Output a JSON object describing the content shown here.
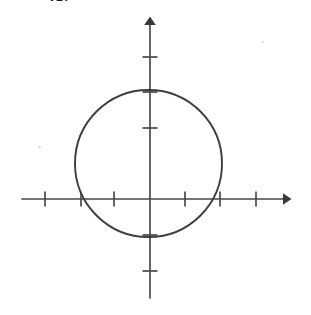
{
  "figure": {
    "problem_label": "41.",
    "background_color": "#ffffff",
    "stroke_color": "#3e3e3e",
    "axis_color": "#4a4a4a"
  },
  "chart_data": {
    "type": "scatter",
    "title": "",
    "subtitle": "",
    "xlabel": "",
    "ylabel": "",
    "grid": false,
    "legend": null,
    "axes": {
      "x": {
        "origin_px": 150,
        "axis_y_px": 199,
        "start_px": 22,
        "end_px": 290,
        "arrow": "right",
        "unit_px": 35.5,
        "tick_positions_px": [
          45,
          81,
          114,
          185,
          220,
          256
        ],
        "tick_values": [
          -3,
          -2,
          -1,
          1,
          2,
          3
        ],
        "tick_labels": [
          "",
          "",
          "",
          "",
          "",
          ""
        ],
        "xlim": [
          -3.6,
          3.9
        ]
      },
      "y": {
        "origin_px": 199,
        "axis_x_px": 150,
        "start_px": 17,
        "end_px": 298,
        "arrow": "up",
        "unit_px": 35.5,
        "tick_positions_px": [
          57,
          92,
          128,
          235,
          271
        ],
        "tick_values": [
          4,
          3,
          2,
          -1,
          -2
        ],
        "tick_labels": [
          "",
          "",
          "",
          "",
          ""
        ],
        "ylim": [
          -2.8,
          5.1
        ]
      }
    },
    "shapes": [
      {
        "kind": "circle",
        "center_units": [
          0,
          1
        ],
        "radius_units": 2,
        "center_px": [
          148.5,
          163.5
        ],
        "radius_px": 73.5,
        "stroke": "#3e3e3e",
        "stroke_width_px": 1.9,
        "fill": "none",
        "equation": "x^2 + (y - 1)^2 = 4"
      }
    ],
    "annotations": []
  }
}
